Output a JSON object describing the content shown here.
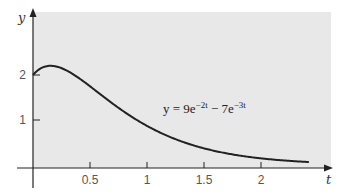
{
  "chart_data": {
    "type": "line",
    "title": "",
    "xlabel": "t",
    "ylabel": "y",
    "xlim": [
      0,
      2.6
    ],
    "ylim": [
      0,
      3.4
    ],
    "x_ticks": [
      "0.5",
      "1",
      "1.5",
      "2"
    ],
    "y_ticks": [
      "1",
      "2"
    ],
    "grid": false,
    "background": "#e8e8e8",
    "annotation": {
      "text_parts": [
        "y = 9e",
        "−2t",
        " − 7e",
        "−3t"
      ],
      "position": {
        "t": 0.95,
        "y": 1.05
      }
    },
    "series": [
      {
        "name": "y = 9e^{-2t} - 7e^{-3t}",
        "formula": "9*exp(-2t) - 7*exp(-3t)",
        "color": "#222222",
        "x": [
          0,
          0.05,
          0.1,
          0.154,
          0.2,
          0.3,
          0.4,
          0.5,
          0.6,
          0.7,
          0.8,
          0.9,
          1.0,
          1.2,
          1.4,
          1.6,
          1.8,
          2.0,
          2.2,
          2.4
        ],
        "values": [
          2.0,
          2.12,
          2.18,
          2.2,
          2.19,
          2.1,
          1.96,
          1.79,
          1.62,
          1.46,
          1.3,
          1.15,
          1.03,
          0.8,
          0.62,
          0.47,
          0.36,
          0.28,
          0.21,
          0.16
        ]
      }
    ]
  }
}
